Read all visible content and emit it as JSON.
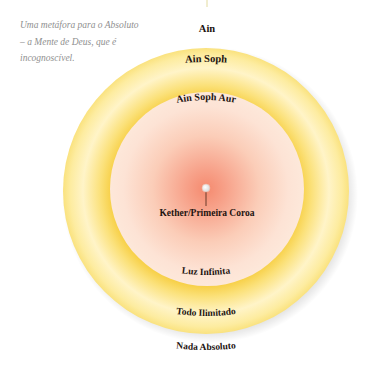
{
  "caption": {
    "lines": [
      "Uma metáfora para o Absoluto",
      "– a Mente de Deus, que é",
      "incognoscível."
    ]
  },
  "diagram": {
    "labels": {
      "ain": "Ain",
      "ain_soph": "Ain Soph",
      "ain_soph_aur": "Ain Soph Aur",
      "kether": "Kether/Primeira Coroa",
      "luz_infinita": "Luz Infinita",
      "todo_ilimitado": "Todo Ilimitado",
      "nada_absoluto": "Nada Absoluto"
    },
    "colors": {
      "core": "#f79a80",
      "inner_disc_edge": "#fde6d8",
      "ring_inner": "#f8d452",
      "ring_mid": "#fff3c4",
      "ring_outer": "#fbe58a",
      "text": "#1d1410",
      "caption": "#8f8f8f"
    }
  }
}
